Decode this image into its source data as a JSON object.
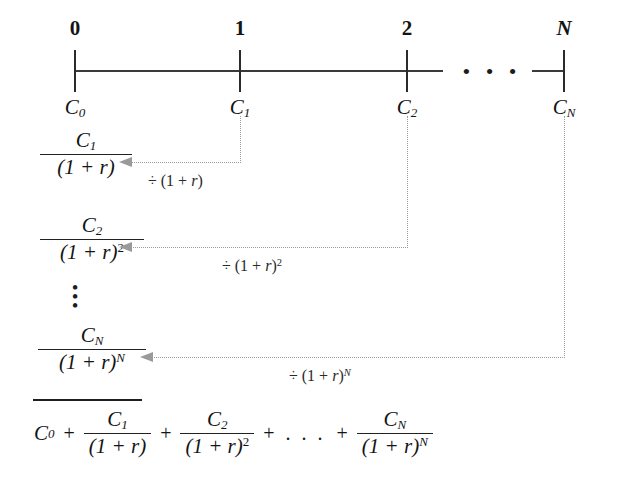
{
  "figure": {
    "type": "timeline-discounting-diagram",
    "background_color": "#ffffff",
    "ink_color": "#1f1f1f",
    "connector_color": "#9a9a9a"
  },
  "timeline": {
    "periods": [
      {
        "label": "0",
        "cash_flow": "C",
        "cash_flow_sub": "0",
        "italic_label": false,
        "x": 75
      },
      {
        "label": "1",
        "cash_flow": "C",
        "cash_flow_sub": "1",
        "italic_label": false,
        "x": 240
      },
      {
        "label": "2",
        "cash_flow": "C",
        "cash_flow_sub": "2",
        "italic_label": false,
        "x": 407
      },
      {
        "label": "N",
        "cash_flow": "C",
        "cash_flow_sub": "N",
        "italic_label": true,
        "x": 564
      }
    ],
    "ellipsis": "•  •  •",
    "axis_y": 71
  },
  "discount_rows": [
    {
      "numerator": "C",
      "numerator_sub": "1",
      "denominator_base": "(1 + r)",
      "denominator_exp": "",
      "operation": "÷ (1 + r)",
      "operation_symbol": "÷",
      "operation_base": "(1 + ",
      "operation_var": "r",
      "operation_close": ")",
      "operation_exp": "",
      "source_period": "1",
      "arrow_y": 162
    },
    {
      "numerator": "C",
      "numerator_sub": "2",
      "denominator_base": "(1 + r)",
      "denominator_exp": "2",
      "operation": "÷ (1 + r)²",
      "operation_symbol": "÷",
      "operation_base": "(1 + ",
      "operation_var": "r",
      "operation_close": ")",
      "operation_exp": "2",
      "source_period": "2",
      "arrow_y": 247
    },
    {
      "numerator": "C",
      "numerator_sub": "N",
      "denominator_base": "(1 + r)",
      "denominator_exp": "N",
      "operation": "÷ (1 + r)ᴺ",
      "operation_symbol": "÷",
      "operation_base": "(1 + ",
      "operation_var": "r",
      "operation_close": ")",
      "operation_exp": "N",
      "source_period": "N",
      "arrow_y": 357
    }
  ],
  "vertical_ellipsis": "•",
  "total": {
    "terms": [
      {
        "kind": "scalar",
        "value": "C",
        "sub": "0"
      },
      {
        "kind": "operator",
        "value": "+"
      },
      {
        "kind": "fraction",
        "num": "C",
        "num_sub": "1",
        "den": "(1 + r)",
        "den_exp": ""
      },
      {
        "kind": "operator",
        "value": "+"
      },
      {
        "kind": "fraction",
        "num": "C",
        "num_sub": "2",
        "den": "(1 + r)",
        "den_exp": "2"
      },
      {
        "kind": "operator",
        "value": "+"
      },
      {
        "kind": "ellipsis",
        "value": ". . ."
      },
      {
        "kind": "operator",
        "value": "+"
      },
      {
        "kind": "fraction",
        "num": "C",
        "num_sub": "N",
        "den": "(1 + r)",
        "den_exp": "N"
      }
    ],
    "plain_text": "C0 + C1/(1 + r) + C2/(1 + r)^2 + . . . + CN/(1 + r)^N"
  }
}
